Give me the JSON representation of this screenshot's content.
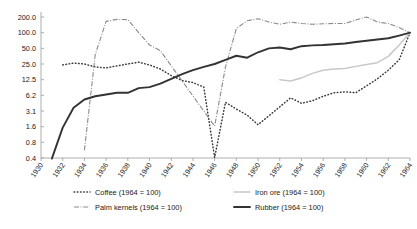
{
  "chart_data": {
    "type": "line",
    "title": "",
    "xlabel": "",
    "ylabel": "",
    "yscale": "log",
    "ylim": [
      0.3,
      260
    ],
    "xlim": [
      1930,
      1964
    ],
    "grid": false,
    "legend_position": "bottom",
    "ytick_labels": [
      "200.0",
      "100.0",
      "50.0",
      "25.0",
      "12.5",
      "6.2",
      "3.1",
      "1.6",
      "0.8",
      "0.4"
    ],
    "ytick_values": [
      200.0,
      100.0,
      50.0,
      25.0,
      12.5,
      6.2,
      3.1,
      1.6,
      0.8,
      0.4
    ],
    "xtick_labels": [
      "1930",
      "1932",
      "1934",
      "1936",
      "1938",
      "1940",
      "1942",
      "1944",
      "1946",
      "1948",
      "1950",
      "1952",
      "1954",
      "1956",
      "1958",
      "1960",
      "1962",
      "1964"
    ],
    "xtick_values": [
      1930,
      1932,
      1934,
      1936,
      1938,
      1940,
      1942,
      1944,
      1946,
      1948,
      1950,
      1952,
      1954,
      1956,
      1958,
      1960,
      1962,
      1964
    ],
    "series": [
      {
        "name": "Coffee (1964 = 100)",
        "key": "coffee",
        "style": "dotted",
        "color": "#3a3a3a",
        "x": [
          1932,
          1933,
          1934,
          1935,
          1936,
          1937,
          1938,
          1939,
          1940,
          1941,
          1942,
          1943,
          1944,
          1945,
          1946,
          1947,
          1948,
          1949,
          1950,
          1953,
          1954,
          1955,
          1956,
          1957,
          1958,
          1959,
          1960,
          1961,
          1962,
          1963,
          1964
        ],
        "y": [
          24,
          26,
          25,
          22,
          21,
          23,
          25,
          27,
          24,
          20,
          15,
          12,
          11,
          9,
          0.4,
          4.6,
          3.4,
          2.6,
          1.7,
          5.6,
          4.4,
          4.9,
          6.0,
          7.0,
          7.3,
          7.0,
          9.5,
          13.0,
          19.0,
          30.0,
          100.0
        ]
      },
      {
        "name": "Iron ore (1964 = 100)",
        "key": "iron_ore",
        "style": "solid-light",
        "color": "#c8c8c8",
        "x": [
          1952,
          1953,
          1954,
          1955,
          1956,
          1957,
          1958,
          1959,
          1960,
          1961,
          1962,
          1963,
          1964
        ],
        "y": [
          12.5,
          11.8,
          13.5,
          16.5,
          19.0,
          20.0,
          20.5,
          22.5,
          24.5,
          26.5,
          35.0,
          58.0,
          100.0
        ]
      },
      {
        "name": "Palm kernels (1964 = 100)",
        "key": "palm_kernels",
        "style": "dash-dot",
        "color": "#8a8a8a",
        "x": [
          1934,
          1935,
          1936,
          1937,
          1938,
          1939,
          1940,
          1941,
          1946,
          1947,
          1948,
          1949,
          1950,
          1951,
          1952,
          1953,
          1954,
          1955,
          1956,
          1957,
          1958,
          1959,
          1960,
          1961,
          1962,
          1963,
          1964
        ],
        "y": [
          0.55,
          38,
          165,
          180,
          178,
          100,
          58,
          45,
          1.6,
          22,
          120,
          170,
          185,
          160,
          145,
          160,
          150,
          145,
          148,
          150,
          150,
          175,
          200,
          160,
          150,
          125,
          100
        ]
      },
      {
        "name": "Rubber (1964 = 100)",
        "key": "rubber",
        "style": "solid-bold",
        "color": "#333333",
        "x": [
          1931,
          1932,
          1933,
          1934,
          1935,
          1936,
          1937,
          1938,
          1939,
          1940,
          1941,
          1942,
          1943,
          1944,
          1945,
          1946,
          1947,
          1948,
          1949,
          1950,
          1951,
          1952,
          1953,
          1954,
          1955,
          1956,
          1957,
          1958,
          1959,
          1960,
          1961,
          1962,
          1963,
          1964
        ],
        "y": [
          0.38,
          1.5,
          3.6,
          5.2,
          6.0,
          6.5,
          7.0,
          7.0,
          8.6,
          9.0,
          10.5,
          13.0,
          16.0,
          19.0,
          22.0,
          25.0,
          30.0,
          36.0,
          33.0,
          42.0,
          50.0,
          52.0,
          48.0,
          55.0,
          57.0,
          58.0,
          60.0,
          62.0,
          66.0,
          70.0,
          74.0,
          78.0,
          88.0,
          100.0
        ]
      }
    ]
  },
  "legend": {
    "entries": [
      {
        "label": "Coffee (1964 = 100)",
        "key": "coffee"
      },
      {
        "label": "Iron ore (1964 = 100)",
        "key": "iron_ore"
      },
      {
        "label": "Palm kernels (1964 = 100)",
        "key": "palm_kernels"
      },
      {
        "label": "Rubber (1964 = 100)",
        "key": "rubber"
      }
    ]
  }
}
